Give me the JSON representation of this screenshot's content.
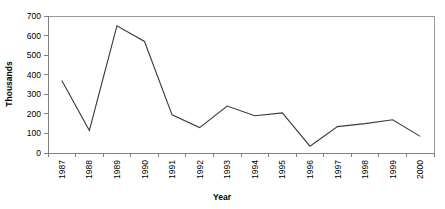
{
  "chart_data": {
    "type": "line",
    "title": "",
    "xlabel": "Year",
    "ylabel": "Thousands",
    "categories": [
      "1987",
      "1988",
      "1989",
      "1990",
      "1991",
      "1992",
      "1993",
      "1994",
      "1995",
      "1996",
      "1997",
      "1998",
      "1999",
      "2000"
    ],
    "values": [
      370,
      115,
      650,
      570,
      195,
      130,
      240,
      190,
      205,
      35,
      135,
      150,
      170,
      85
    ],
    "series": [
      {
        "name": "",
        "values": [
          370,
          115,
          650,
          570,
          195,
          130,
          240,
          190,
          205,
          35,
          135,
          150,
          170,
          85
        ]
      }
    ],
    "ylim": [
      0,
      700
    ],
    "ytick_values": [
      0,
      100,
      200,
      300,
      400,
      500,
      600,
      700
    ],
    "ytick_labels": [
      "0",
      "100",
      "200",
      "300",
      "400",
      "500",
      "600",
      "700"
    ],
    "grid": false,
    "legend": false,
    "legend_position": "none",
    "line_color": "#3a3a3a",
    "axis_color": "#808080",
    "background_color": "#ffffff"
  },
  "axes": {
    "y_title": "Thousands",
    "x_title": "Year"
  }
}
